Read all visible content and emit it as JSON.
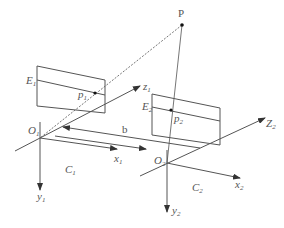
{
  "diagram": {
    "title": "",
    "point": {
      "label": "P"
    },
    "camera1": {
      "name": "C",
      "name_sub": "1",
      "origin": "O",
      "origin_sub": "1",
      "image_plane": "E",
      "image_plane_sub": "1",
      "projection": "p",
      "projection_sub": "1",
      "x_axis": "x",
      "x_axis_sub": "1",
      "y_axis": "y",
      "y_axis_sub": "1",
      "z_axis": "z",
      "z_axis_sub": "1"
    },
    "camera2": {
      "name": "C",
      "name_sub": "2",
      "origin": "O",
      "origin_sub": "2",
      "image_plane": "E",
      "image_plane_sub": "2",
      "projection": "p",
      "projection_sub": "2",
      "x_axis": "x",
      "x_axis_sub": "2",
      "y_axis": "y",
      "y_axis_sub": "2",
      "z_axis": "Z",
      "z_axis_sub": "2"
    },
    "baseline": {
      "label": "b"
    },
    "colors": {
      "line": "#555555",
      "point": "#111111",
      "background": "#ffffff"
    }
  }
}
